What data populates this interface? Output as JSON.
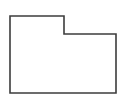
{
  "canvas": {
    "width": 125,
    "height": 105,
    "background_color": "#ffffff",
    "alt_text": "L-shaped stepped hexagon outline"
  },
  "figure": {
    "name": "l-shaped-polygon",
    "shape_type": "polygon",
    "sides": 6,
    "stroke_color": "#3c3c3c",
    "fill_color": "#ffffff",
    "stroke_width": 1.6,
    "points_string": "10,16 64,16 64,34 116,34 116,93 10,93",
    "vertices": [
      {
        "label": "A",
        "role": "top-left",
        "x": 10,
        "y": 16
      },
      {
        "label": "B",
        "role": "top-step-right",
        "x": 64,
        "y": 16
      },
      {
        "label": "C",
        "role": "inner-step-corner",
        "x": 64,
        "y": 34
      },
      {
        "label": "D",
        "role": "right-upper",
        "x": 116,
        "y": 34
      },
      {
        "label": "E",
        "role": "bottom-right",
        "x": 116,
        "y": 93
      },
      {
        "label": "F",
        "role": "bottom-left",
        "x": 10,
        "y": 93
      }
    ],
    "edges": [
      {
        "name": "top-edge",
        "from": "A",
        "to": "B",
        "orientation": "horizontal",
        "length": 54
      },
      {
        "name": "step-vertical-edge",
        "from": "B",
        "to": "C",
        "orientation": "vertical",
        "length": 18
      },
      {
        "name": "step-horizontal-edge",
        "from": "C",
        "to": "D",
        "orientation": "horizontal",
        "length": 52
      },
      {
        "name": "right-edge",
        "from": "D",
        "to": "E",
        "orientation": "vertical",
        "length": 59
      },
      {
        "name": "bottom-edge",
        "from": "E",
        "to": "F",
        "orientation": "horizontal",
        "length": 106
      },
      {
        "name": "left-edge",
        "from": "F",
        "to": "A",
        "orientation": "vertical",
        "length": 77
      }
    ],
    "bounding_box": {
      "x": 10,
      "y": 16,
      "width": 106,
      "height": 77
    },
    "notch": {
      "x": 64,
      "y": 16,
      "width": 52,
      "height": 18
    }
  }
}
